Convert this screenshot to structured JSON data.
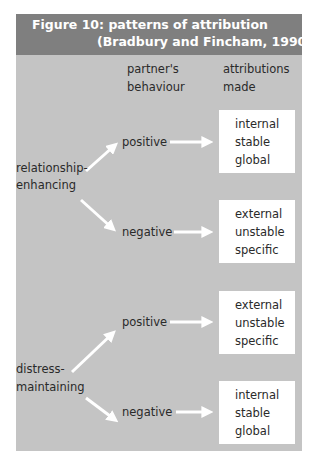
{
  "figure": {
    "title_line1": "Figure 10: patterns of attribution",
    "title_line2": "(Bradbury and Fincham, 1990)",
    "column_headers": {
      "behaviour_line1": "partner's",
      "behaviour_line2": "behaviour",
      "attributions_line1": "attributions",
      "attributions_line2": "made"
    },
    "groups": [
      {
        "label_line1": "relationship-",
        "label_line2": "enhancing",
        "branches": [
          {
            "behaviour": "positive",
            "attributions": [
              "internal",
              "stable",
              "global"
            ]
          },
          {
            "behaviour": "negative",
            "attributions": [
              "external",
              "unstable",
              "specific"
            ]
          }
        ]
      },
      {
        "label_line1": "distress-",
        "label_line2": "maintaining",
        "branches": [
          {
            "behaviour": "positive",
            "attributions": [
              "external",
              "unstable",
              "specific"
            ]
          },
          {
            "behaviour": "negative",
            "attributions": [
              "internal",
              "stable",
              "global"
            ]
          }
        ]
      }
    ],
    "colors": {
      "header_bg": "#7f7f7f",
      "panel_bg": "#c4c4c4",
      "box_bg": "#ffffff",
      "arrow": "#ffffff"
    }
  }
}
